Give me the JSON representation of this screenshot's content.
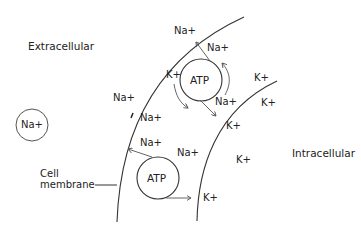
{
  "diagram": {
    "regions": {
      "extracellular": "Extracellular",
      "intracellular": "Intracellular"
    },
    "membrane_label_line1": "Cell",
    "membrane_label_line2": "membrane",
    "pumps": [
      {
        "label": "ATP"
      },
      {
        "label": "ATP"
      }
    ],
    "free_ion": "Na+",
    "ions": {
      "na": "Na+",
      "k": "K+"
    },
    "colors": {
      "line": "#333333",
      "arrow": "#555555",
      "text": "#222222",
      "background": "#ffffff"
    }
  }
}
